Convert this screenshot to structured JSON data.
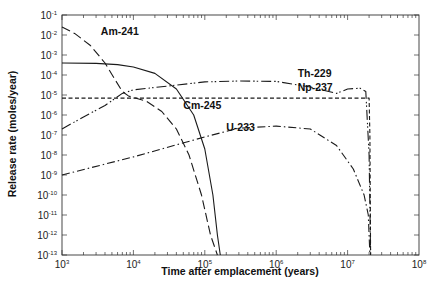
{
  "chart_data": {
    "type": "line",
    "title": "",
    "xlabel": "Time after emplacement (years)",
    "ylabel": "Release rate (moles/year)",
    "xscale": "log",
    "yscale": "log",
    "xlim": [
      1000,
      100000000
    ],
    "ylim": [
      1e-13,
      0.1
    ],
    "x_ticks": [
      {
        "base": "10",
        "exp": "3",
        "value": 1000
      },
      {
        "base": "10",
        "exp": "4",
        "value": 10000
      },
      {
        "base": "10",
        "exp": "5",
        "value": 100000
      },
      {
        "base": "10",
        "exp": "6",
        "value": 1000000
      },
      {
        "base": "10",
        "exp": "7",
        "value": 10000000
      },
      {
        "base": "10",
        "exp": "8",
        "value": 100000000
      }
    ],
    "y_ticks": [
      {
        "base": "10",
        "exp": "-1",
        "value": 0.1
      },
      {
        "base": "10",
        "exp": "-2",
        "value": 0.01
      },
      {
        "base": "10",
        "exp": "-3",
        "value": 0.001
      },
      {
        "base": "10",
        "exp": "-4",
        "value": 0.0001
      },
      {
        "base": "10",
        "exp": "-5",
        "value": 1e-05
      },
      {
        "base": "10",
        "exp": "-6",
        "value": 1e-06
      },
      {
        "base": "10",
        "exp": "-7",
        "value": 1e-07
      },
      {
        "base": "10",
        "exp": "-8",
        "value": 1e-08
      },
      {
        "base": "10",
        "exp": "-9",
        "value": 1e-09
      },
      {
        "base": "10",
        "exp": "-10",
        "value": 1e-10
      },
      {
        "base": "10",
        "exp": "-11",
        "value": 1e-11
      },
      {
        "base": "10",
        "exp": "-12",
        "value": 1e-12
      },
      {
        "base": "10",
        "exp": "-13",
        "value": 1e-13
      }
    ],
    "grid": false,
    "legend": "inline labels",
    "series": [
      {
        "name": "Am-241",
        "style": "long-dash",
        "label_pos": {
          "x": 3500,
          "y": 0.01
        },
        "points": [
          [
            1000,
            0.025
          ],
          [
            1500,
            0.012
          ],
          [
            2500,
            0.003
          ],
          [
            4000,
            0.0004
          ],
          [
            5500,
            6e-05
          ],
          [
            7000,
            1.5e-05
          ],
          [
            8500,
            9e-06
          ],
          [
            10000,
            7.5e-06
          ],
          [
            15000,
            5e-06
          ],
          [
            25000,
            1.5e-06
          ],
          [
            40000,
            2e-07
          ],
          [
            60000,
            1e-08
          ],
          [
            90000,
            1e-10
          ],
          [
            120000,
            1e-12
          ],
          [
            150000,
            1e-13
          ]
        ]
      },
      {
        "name": "Cm-245",
        "style": "solid",
        "label_pos": {
          "x": 50000,
          "y": 2e-06
        },
        "points": [
          [
            1000,
            0.0004
          ],
          [
            3000,
            0.00038
          ],
          [
            6000,
            0.00033
          ],
          [
            10000,
            0.00025
          ],
          [
            20000,
            0.00012
          ],
          [
            40000,
            2e-05
          ],
          [
            70000,
            1e-06
          ],
          [
            100000,
            2e-08
          ],
          [
            130000,
            1e-10
          ],
          [
            150000,
            1e-12
          ],
          [
            165000,
            1e-13
          ]
        ]
      },
      {
        "name": "Th-229",
        "style": "dash-dot-dot",
        "label_pos": {
          "x": 2000000,
          "y": 8e-05
        },
        "points": [
          [
            1000,
            2e-07
          ],
          [
            2000,
            8e-07
          ],
          [
            4000,
            3e-06
          ],
          [
            7000,
            1.2e-05
          ],
          [
            10000,
            1.8e-05
          ],
          [
            30000,
            2.8e-05
          ],
          [
            100000,
            4.5e-05
          ],
          [
            300000,
            5e-05
          ],
          [
            1000000,
            4.8e-05
          ],
          [
            3000000,
            2.5e-05
          ],
          [
            7000000,
            1.2e-05
          ],
          [
            10000000,
            2e-05
          ],
          [
            15000000,
            2.2e-05
          ],
          [
            18000000,
            1.5e-05
          ],
          [
            20000000,
            1e-08
          ],
          [
            21000000,
            1e-13
          ]
        ]
      },
      {
        "name": "Np-237",
        "style": "short-dash",
        "label_pos": {
          "x": 2000000,
          "y": 1.5e-05
        },
        "points": [
          [
            1000,
            7e-06
          ],
          [
            100000,
            7e-06
          ],
          [
            1000000,
            7e-06
          ],
          [
            10000000,
            7e-06
          ],
          [
            20000000,
            7e-06
          ],
          [
            20500000,
            1e-07
          ],
          [
            21000000,
            1e-13
          ]
        ]
      },
      {
        "name": "U-233",
        "style": "dash-dot",
        "label_pos": {
          "x": 200000,
          "y": 1.5e-07
        },
        "points": [
          [
            1000,
            1e-09
          ],
          [
            10000,
            8e-09
          ],
          [
            100000,
            8e-08
          ],
          [
            300000,
            2.2e-07
          ],
          [
            1000000,
            2.8e-07
          ],
          [
            3000000,
            2e-07
          ],
          [
            7000000,
            3e-08
          ],
          [
            12000000,
            2e-09
          ],
          [
            17000000,
            1e-10
          ],
          [
            19500000,
            1e-11
          ],
          [
            20500000,
            1e-13
          ]
        ]
      }
    ]
  }
}
